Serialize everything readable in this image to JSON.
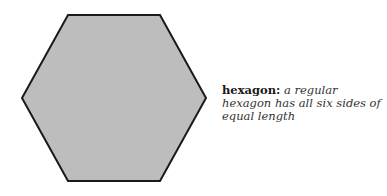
{
  "figure": {
    "shape": {
      "type": "hexagon",
      "fill_color": "#bdbdbd",
      "stroke_color": "#1a1a1a",
      "stroke_width": 2,
      "points": "68,15 160,15 206,98 160,181 68,181 22,98"
    },
    "caption": {
      "term": "hexagon:",
      "definition": "a regular hexagon has all six sides of equal length"
    }
  }
}
